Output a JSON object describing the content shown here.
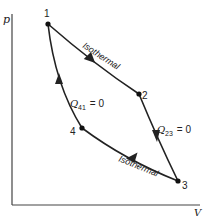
{
  "diagram": {
    "type": "pV cycle diagram",
    "axes": {
      "y_label": "p",
      "x_label": "V"
    },
    "points": [
      {
        "id": "1",
        "label": "1"
      },
      {
        "id": "2",
        "label": "2"
      },
      {
        "id": "3",
        "label": "3"
      },
      {
        "id": "4",
        "label": "4"
      }
    ],
    "processes": [
      {
        "from": "1",
        "to": "2",
        "label": "Isothermal"
      },
      {
        "from": "2",
        "to": "3",
        "label_q": "Q",
        "label_sub": "23",
        "label_eq": " = 0"
      },
      {
        "from": "3",
        "to": "4",
        "label": "Isothermal"
      },
      {
        "from": "4",
        "to": "1",
        "label_q": "Q",
        "label_sub": "41",
        "label_eq": " = 0"
      }
    ]
  }
}
